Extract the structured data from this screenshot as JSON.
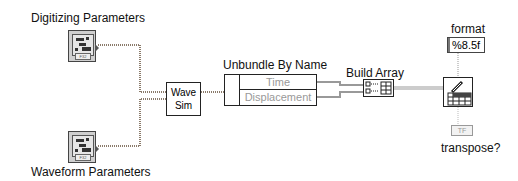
{
  "diagram": {
    "controls": {
      "digitizing": {
        "label": "Digitizing Parameters"
      },
      "waveform": {
        "label": "Waveform Parameters"
      }
    },
    "wave_sim": {
      "line1": "Wave",
      "line2": "Sim"
    },
    "unbundle": {
      "title": "Unbundle By Name",
      "fields": [
        "Time",
        "Displacement"
      ]
    },
    "build_array": {
      "title": "Build Array"
    },
    "format": {
      "label": "format",
      "value": "%8.5f"
    },
    "transpose": {
      "label": "transpose?",
      "value": "TF"
    },
    "colors": {
      "wire_cluster": "#8a6a55",
      "wire_array": "#e07020",
      "wire_string": "#d060a0",
      "wire_bool": "#00a000"
    }
  }
}
